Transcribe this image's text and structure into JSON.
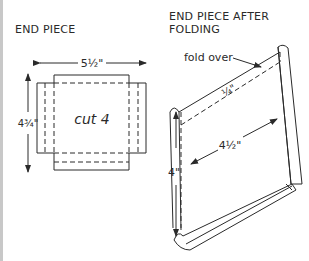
{
  "left_panel": {
    "title": "END PIECE",
    "width_label": "5½\"",
    "height_label": "4¾\"",
    "center_label": "cut 4"
  },
  "right_panel": {
    "title_line1": "END PIECE AFTER",
    "title_line2": "FOLDING",
    "fold_label": "fold over",
    "seam_label": "¼\"",
    "width_label": "4½\"",
    "height_label": "4\""
  },
  "colors": {
    "line": "#2a2a2a",
    "edge": "#c8c8c8",
    "background": "#ffffff"
  }
}
